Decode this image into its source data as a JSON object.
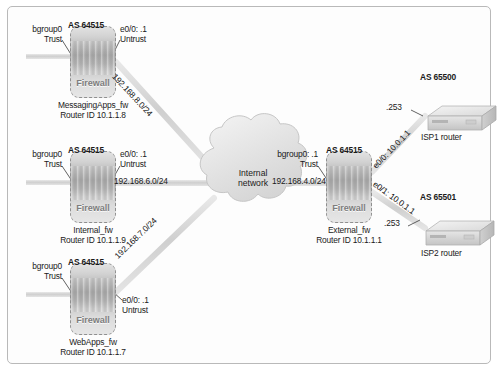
{
  "figure": {
    "cloud_label_line1": "Internal",
    "cloud_label_line2": "network",
    "firewall_icon_text": "Firewall"
  },
  "firewalls": [
    {
      "id": "messaging",
      "as_label": "AS 64515",
      "trust_line1": "bgroup0",
      "trust_line2": "Trust",
      "untrust_line1": "e0/0: .1",
      "untrust_line2": "Untrust",
      "name": "MessagingApps_fw",
      "router_id": "Router ID 10.1.1.8"
    },
    {
      "id": "internal",
      "as_label": "AS 64515",
      "trust_line1": "bgroup0",
      "trust_line2": "Trust",
      "untrust_line1": "e0/0: .1",
      "untrust_line2": "Untrust",
      "name": "Internal_fw",
      "router_id": "Router ID 10.1.1.9"
    },
    {
      "id": "webapps",
      "as_label": "AS 64515",
      "trust_line1": "bgroup0",
      "trust_line2": "Trust",
      "untrust_line1": "e0/0: .1",
      "untrust_line2": "Untrust",
      "name": "WebApps_fw",
      "router_id": "Router ID 10.1.1.7"
    },
    {
      "id": "external",
      "as_label": "AS 64515",
      "trust_line1": "bgroup0: .1",
      "trust_line2": "Trust",
      "name": "External_fw",
      "router_id": "Router ID 10.1.1.1",
      "uplink1": "e0/0: 10.0.1.1",
      "uplink2": "e0/1: 10.0.1.1"
    }
  ],
  "links": [
    {
      "id": "messaging-cloud",
      "label": "192.168.8.0/24"
    },
    {
      "id": "internal-cloud",
      "label": "192.168.6.0/24"
    },
    {
      "id": "webapps-cloud",
      "label": "192.168.7.0/24"
    },
    {
      "id": "cloud-external",
      "label": "192.168.4.0/24"
    }
  ],
  "routers": [
    {
      "id": "isp1",
      "as_label": "AS 65500",
      "name": "ISP1 router",
      "peer_address": ".253"
    },
    {
      "id": "isp2",
      "as_label": "AS 65501",
      "name": "ISP2 router",
      "peer_address": ".253"
    }
  ]
}
